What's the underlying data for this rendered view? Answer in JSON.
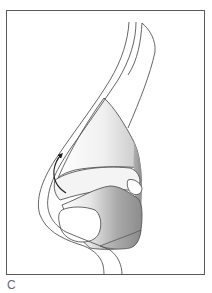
{
  "figure": {
    "panel_label": "C",
    "frame_color": "#5a5a5a",
    "line_color": "#555555",
    "arrow_color": "#1a1a1a",
    "shading": {
      "dark": "#8c8c8c",
      "mid": "#b4b4b4",
      "light": "#e6e6e6",
      "highlight": "#ffffff"
    },
    "elements": [
      {
        "name": "skin-contour",
        "description": "outer nasal dorsum profile line"
      },
      {
        "name": "upper-lateral-cartilage",
        "description": "inner parallel contour line"
      },
      {
        "name": "nasal-bone",
        "description": "upper pointed bone outline"
      },
      {
        "name": "lower-lateral-cartilage",
        "description": "shaded tip cartilage region"
      },
      {
        "name": "alar-lobule",
        "description": "lower shaded cartilage region"
      },
      {
        "name": "direction-arrow",
        "description": "curved arrow pointing upward"
      }
    ]
  }
}
